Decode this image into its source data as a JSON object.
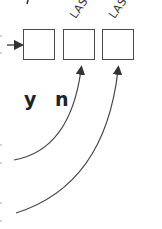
{
  "diagram": {
    "boxes": [
      {
        "id": "box-1",
        "label": ""
      },
      {
        "id": "box-2",
        "label": ""
      },
      {
        "id": "box-3",
        "label": ""
      }
    ],
    "rotated_labels": [
      {
        "text": "LAS",
        "above": "box-2"
      },
      {
        "text": "LAS",
        "above": "box-3"
      }
    ],
    "letters": [
      {
        "text": "y"
      },
      {
        "text": "n"
      }
    ],
    "arrows": [
      {
        "from": "left-edge",
        "to": "box-1",
        "direction": "right"
      },
      {
        "from": "left-edge-lower-1",
        "to": "box-2",
        "shape": "curve-up"
      },
      {
        "from": "left-edge-lower-2",
        "to": "box-3",
        "shape": "curve-up"
      }
    ],
    "colors": {
      "stroke": "#4a4a4a",
      "text": "#222222"
    }
  }
}
